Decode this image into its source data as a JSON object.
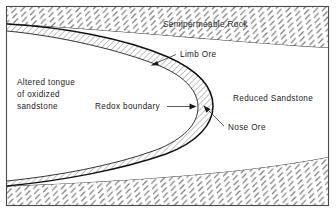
{
  "figure": {
    "title_visible": false,
    "frame": {
      "border_color": "#4a4a4a",
      "background": "#ffffff"
    },
    "labels": {
      "semipermeable_rock": "Semipermeable Rock",
      "limb_ore": "Limb Ore",
      "redox_boundary": "Redox boundary",
      "reduced_sandstone": "Reduced Sandstone",
      "nose_ore": "Nose Ore",
      "altered_tongue_line1": "Altered tongue",
      "altered_tongue_line2": "of oxidized",
      "altered_tongue_line3": "sandstone"
    },
    "colors": {
      "ink": "#1a1a1a",
      "hatch_rock": "#707070",
      "hatch_ore": "#3a3a3a",
      "sandstone_fill": "#ffffff",
      "tongue_fill": "#ffffff",
      "ore_fill": "#f2f2f2"
    },
    "regions": [
      {
        "name": "semipermeable-rock-upper",
        "label": "Semipermeable Rock",
        "pattern": "dashed-diagonal-hatch"
      },
      {
        "name": "semipermeable-rock-lower",
        "label": "Semipermeable Rock",
        "pattern": "dashed-diagonal-hatch"
      },
      {
        "name": "reduced-sandstone",
        "label": "Reduced Sandstone",
        "pattern": "none"
      },
      {
        "name": "altered-oxidized-tongue",
        "label": "Altered tongue of oxidized sandstone",
        "pattern": "none"
      },
      {
        "name": "ore-body",
        "label": "Nose Ore / Limb Ore",
        "pattern": "diagonal-line-hatch"
      }
    ]
  }
}
